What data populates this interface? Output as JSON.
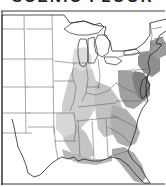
{
  "figure": {
    "title": "SCENIC FLOOR",
    "title_clipped": true,
    "caption": "",
    "background_color": "#ffffff"
  },
  "map": {
    "name": "eastern-united-states-distribution-map",
    "projection_region": "Eastern and central United States",
    "line_color": "#262626",
    "state_border_color": "#5d5d5d",
    "frame_color": "#3a3a3a",
    "water_color": "#ffffff",
    "shading": {
      "type": "range-distribution",
      "light_color": "#c9c9c9",
      "medium_color": "#a8a8a8",
      "dark_color": "#8a8a8a",
      "regions": [
        "Mississippi Valley",
        "Lower Mississippi and Gulf Coast",
        "Southern Appalachians",
        "Atlantic Coastal Plain",
        "Florida Peninsula",
        "Chesapeake and Delmarva",
        "Southern New England coast"
      ]
    },
    "features": [
      {
        "name": "Great Lakes",
        "type": "water"
      },
      {
        "name": "Lake Michigan",
        "type": "water"
      },
      {
        "name": "Lake Superior",
        "type": "water"
      },
      {
        "name": "Lake Huron",
        "type": "water"
      },
      {
        "name": "Lake Erie",
        "type": "water"
      },
      {
        "name": "Lake Ontario",
        "type": "water"
      },
      {
        "name": "Atlantic Coast",
        "type": "coastline"
      },
      {
        "name": "Gulf of Mexico",
        "type": "coastline"
      },
      {
        "name": "Florida Peninsula",
        "type": "coastline"
      },
      {
        "name": "Texas",
        "type": "state"
      },
      {
        "name": "Mexico border",
        "type": "border"
      }
    ],
    "legend_present": false,
    "scale_bar_present": false,
    "labels_present": false
  }
}
